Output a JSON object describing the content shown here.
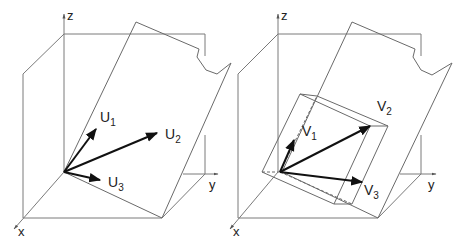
{
  "figure": {
    "panels": [
      {
        "id": "left",
        "axes": {
          "x": "x",
          "y": "y",
          "z": "z"
        },
        "vectors": [
          {
            "name": "U",
            "sub": "1"
          },
          {
            "name": "U",
            "sub": "2"
          },
          {
            "name": "U",
            "sub": "3"
          }
        ]
      },
      {
        "id": "right",
        "axes": {
          "x": "x",
          "y": "y",
          "z": "z"
        },
        "vectors": [
          {
            "name": "V",
            "sub": "1"
          },
          {
            "name": "V",
            "sub": "2"
          },
          {
            "name": "V",
            "sub": "3"
          }
        ]
      }
    ],
    "colors": {
      "line": "#7a7a7a",
      "vector": "#111111",
      "text": "#222222"
    }
  }
}
